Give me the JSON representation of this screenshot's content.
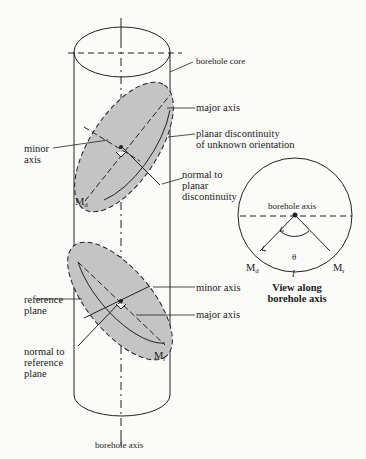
{
  "labels": {
    "borehole_core": "borehole core",
    "major_axis_upper": "major axis",
    "planar_line1": "planar discontinuity",
    "planar_line2": "of unknown orientation",
    "minor_axis_upper_l1": "minor",
    "minor_axis_upper_l2": "axis",
    "normal_planar_l1": "normal to",
    "normal_planar_l2": "planar",
    "normal_planar_l3": "discontinuity",
    "Md_upper": "M",
    "Md_upper_sub": "d",
    "minor_axis_lower": "minor axis",
    "reference_plane_l1": "reference",
    "reference_plane_l2": "plane",
    "major_axis_lower": "major axis",
    "normal_ref_l1": "normal to",
    "normal_ref_l2": "reference",
    "normal_ref_l3": "plane",
    "Mr_lower": "M",
    "Mr_lower_sub": "r",
    "borehole_axis_bottom": "borehole axis"
  },
  "inset": {
    "borehole_axis": "borehole axis",
    "theta": "θ",
    "Md": "M",
    "Md_sub": "d",
    "Mr": "M",
    "Mr_sub": "r",
    "arc_label": "l",
    "caption_l1": "View along",
    "caption_l2": "borehole axis"
  },
  "colors": {
    "fill": "#c4c4c4",
    "stroke": "#222222",
    "background": "#fbfbf9"
  }
}
